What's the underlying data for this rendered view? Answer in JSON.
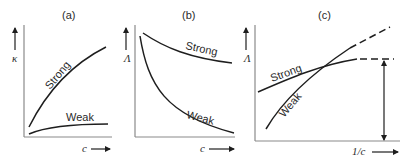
{
  "figure": {
    "panels": [
      {
        "id": "a",
        "label": "(a)",
        "y_axis_label": "κ",
        "x_axis_label": "c",
        "curves": [
          {
            "name": "Strong",
            "label": "Strong",
            "trend": "rising, concave down"
          },
          {
            "name": "Weak",
            "label": "Weak",
            "trend": "low, nearly flat, slight rise"
          }
        ]
      },
      {
        "id": "b",
        "label": "(b)",
        "y_axis_label": "Λ",
        "x_axis_label": "c",
        "curves": [
          {
            "name": "Strong",
            "label": "Strong",
            "trend": "high, gently decreasing"
          },
          {
            "name": "Weak",
            "label": "Weak",
            "trend": "steeply decreasing, then flattening"
          }
        ]
      },
      {
        "id": "c",
        "label": "(c)",
        "y_axis_label": "Λ",
        "x_axis_label": "1/c",
        "curves": [
          {
            "name": "Strong",
            "label": "Strong",
            "trend": "rising, leveling off to dashed horizontal asymptote"
          },
          {
            "name": "Weak",
            "label": "Weak",
            "trend": "steeply rising, continuing as dashed extrapolation"
          }
        ],
        "annotation": "double-headed vertical arrow indicating limiting value"
      }
    ]
  }
}
